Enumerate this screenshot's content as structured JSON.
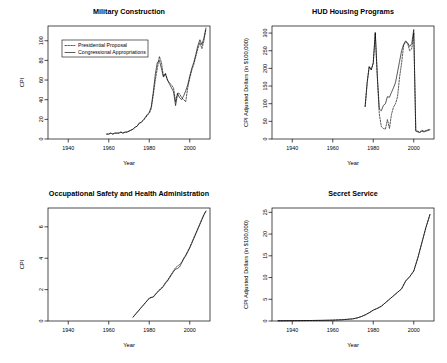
{
  "figure": {
    "layout": "2x2 panel grid of line charts",
    "background": "#ffffff",
    "line_color": "#000000"
  },
  "shared": {
    "xlabel": "Year",
    "xticks": [
      1940,
      1960,
      1980,
      2000
    ],
    "xlim": [
      1930,
      2010
    ],
    "legend": {
      "entries": [
        {
          "label": "Presidential Proposal",
          "style": "dashed"
        },
        {
          "label": "Congressional Appropriations",
          "style": "solid"
        }
      ]
    }
  },
  "chart_data": [
    {
      "type": "line",
      "panel": "top-left",
      "title": "Military Construction",
      "xlabel": "Year",
      "ylabel": "CPI",
      "xlim": [
        1930,
        2010
      ],
      "ylim": [
        0,
        115
      ],
      "xticks": [
        1940,
        1960,
        1980,
        2000
      ],
      "yticks": [
        0,
        20,
        40,
        60,
        80,
        100
      ],
      "grid": false,
      "legend_position": "top-left inside",
      "series": [
        {
          "name": "Presidential Proposal",
          "style": "dashed",
          "x": [
            1959,
            1960,
            1961,
            1962,
            1963,
            1964,
            1965,
            1966,
            1967,
            1968,
            1969,
            1970,
            1971,
            1972,
            1973,
            1974,
            1975,
            1976,
            1977,
            1978,
            1979,
            1980,
            1981,
            1982,
            1983,
            1984,
            1985,
            1986,
            1987,
            1988,
            1989,
            1990,
            1991,
            1992,
            1993,
            1994,
            1995,
            1996,
            1997,
            1998,
            1999,
            2000,
            2001,
            2002,
            2003,
            2004,
            2005,
            2006,
            2007,
            2008
          ],
          "values": [
            5,
            5,
            6,
            5,
            6,
            6,
            6,
            7,
            6,
            7,
            7,
            8,
            9,
            10,
            12,
            13,
            16,
            17,
            19,
            21,
            24,
            26,
            31,
            45,
            60,
            72,
            84,
            78,
            64,
            67,
            60,
            57,
            55,
            52,
            38,
            47,
            46,
            42,
            40,
            38,
            52,
            62,
            70,
            76,
            84,
            92,
            98,
            92,
            100,
            112
          ]
        },
        {
          "name": "Congressional Appropriations",
          "style": "solid",
          "x": [
            1959,
            1960,
            1961,
            1962,
            1963,
            1964,
            1965,
            1966,
            1967,
            1968,
            1969,
            1970,
            1971,
            1972,
            1973,
            1974,
            1975,
            1976,
            1977,
            1978,
            1979,
            1980,
            1981,
            1982,
            1983,
            1984,
            1985,
            1986,
            1987,
            1988,
            1989,
            1990,
            1991,
            1992,
            1993,
            1994,
            1995,
            1996,
            1997,
            1998,
            1999,
            2000,
            2001,
            2002,
            2003,
            2004,
            2005,
            2006,
            2007,
            2008
          ],
          "values": [
            5,
            5,
            6,
            5,
            6,
            6,
            6,
            7,
            6,
            7,
            7,
            8,
            9,
            10,
            12,
            13,
            16,
            17,
            19,
            22,
            25,
            27,
            33,
            48,
            66,
            78,
            80,
            72,
            63,
            66,
            60,
            56,
            52,
            48,
            34,
            46,
            42,
            40,
            44,
            49,
            55,
            64,
            72,
            78,
            86,
            95,
            101,
            96,
            103,
            113
          ]
        }
      ]
    },
    {
      "type": "line",
      "panel": "top-right",
      "title": "HUD Housing Programs",
      "xlabel": "Year",
      "ylabel": "CPI Adjusted Dollars (in $100,000)",
      "xlim": [
        1930,
        2010
      ],
      "ylim": [
        0,
        320
      ],
      "xticks": [
        1940,
        1960,
        1980,
        2000
      ],
      "yticks": [
        0,
        50,
        100,
        150,
        200,
        250,
        300
      ],
      "grid": false,
      "series": [
        {
          "name": "Presidential Proposal",
          "style": "dashed",
          "x": [
            1976,
            1977,
            1978,
            1979,
            1980,
            1981,
            1982,
            1983,
            1984,
            1985,
            1986,
            1987,
            1988,
            1989,
            1990,
            1991,
            1992,
            1993,
            1994,
            1995,
            1996,
            1997,
            1998,
            1999,
            2000,
            2001,
            2002,
            2003,
            2004,
            2005,
            2006,
            2007,
            2008
          ],
          "values": [
            92,
            160,
            205,
            196,
            215,
            300,
            175,
            70,
            35,
            30,
            28,
            55,
            30,
            70,
            90,
            100,
            120,
            175,
            215,
            265,
            275,
            270,
            250,
            255,
            300,
            25,
            22,
            20,
            25,
            22,
            24,
            26,
            28
          ]
        },
        {
          "name": "Congressional Appropriations",
          "style": "solid",
          "x": [
            1976,
            1977,
            1978,
            1979,
            1980,
            1981,
            1982,
            1983,
            1984,
            1985,
            1986,
            1987,
            1988,
            1989,
            1990,
            1991,
            1992,
            1993,
            1994,
            1995,
            1996,
            1997,
            1998,
            1999,
            2000,
            2001,
            2002,
            2003,
            2004,
            2005,
            2006,
            2007,
            2008
          ],
          "values": [
            92,
            160,
            205,
            196,
            215,
            302,
            180,
            85,
            80,
            95,
            100,
            120,
            118,
            132,
            145,
            160,
            190,
            220,
            250,
            268,
            278,
            272,
            262,
            270,
            310,
            22,
            20,
            18,
            22,
            20,
            22,
            24,
            26
          ]
        }
      ]
    },
    {
      "type": "line",
      "panel": "bottom-left",
      "title": "Occupational Safety and Health Administration",
      "xlabel": "Year",
      "ylabel": "CPI",
      "xlim": [
        1930,
        2010
      ],
      "ylim": [
        0,
        7.2
      ],
      "xticks": [
        1940,
        1960,
        1980,
        2000
      ],
      "yticks": [
        0,
        2,
        4,
        6
      ],
      "grid": false,
      "series": [
        {
          "name": "Presidential Proposal",
          "style": "dashed",
          "x": [
            1972,
            1973,
            1974,
            1975,
            1976,
            1977,
            1978,
            1979,
            1980,
            1981,
            1982,
            1983,
            1984,
            1985,
            1986,
            1987,
            1988,
            1989,
            1990,
            1991,
            1992,
            1993,
            1994,
            1995,
            1996,
            1997,
            1998,
            1999,
            2000,
            2001,
            2002,
            2003,
            2004,
            2005,
            2006,
            2007,
            2008
          ],
          "values": [
            0.25,
            0.4,
            0.55,
            0.7,
            0.85,
            1.0,
            1.15,
            1.3,
            1.45,
            1.5,
            1.55,
            1.7,
            1.85,
            2.0,
            2.1,
            2.25,
            2.45,
            2.6,
            2.8,
            3.0,
            3.2,
            3.4,
            3.5,
            3.6,
            3.75,
            4.0,
            4.2,
            4.45,
            4.7,
            5.0,
            5.3,
            5.6,
            5.9,
            6.2,
            6.5,
            6.8,
            7.0
          ]
        },
        {
          "name": "Congressional Appropriations",
          "style": "solid",
          "x": [
            1972,
            1973,
            1974,
            1975,
            1976,
            1977,
            1978,
            1979,
            1980,
            1981,
            1982,
            1983,
            1984,
            1985,
            1986,
            1987,
            1988,
            1989,
            1990,
            1991,
            1992,
            1993,
            1994,
            1995,
            1996,
            1997,
            1998,
            1999,
            2000,
            2001,
            2002,
            2003,
            2004,
            2005,
            2006,
            2007,
            2008
          ],
          "values": [
            0.25,
            0.4,
            0.55,
            0.7,
            0.85,
            1.0,
            1.15,
            1.3,
            1.45,
            1.5,
            1.52,
            1.68,
            1.82,
            1.95,
            2.05,
            2.2,
            2.4,
            2.55,
            2.75,
            2.95,
            3.15,
            3.3,
            3.35,
            3.45,
            3.7,
            3.95,
            4.15,
            4.4,
            4.65,
            4.95,
            5.25,
            5.55,
            5.85,
            6.15,
            6.45,
            6.75,
            7.0
          ]
        }
      ]
    },
    {
      "type": "line",
      "panel": "bottom-right",
      "title": "Secret Service",
      "xlabel": "Year",
      "ylabel": "CPI Adjusted Dollars (in $100,000)",
      "xlim": [
        1930,
        2010
      ],
      "ylim": [
        0,
        26
      ],
      "xticks": [
        1940,
        1960,
        1980,
        2000
      ],
      "yticks": [
        0,
        5,
        10,
        15,
        20,
        25
      ],
      "grid": false,
      "series": [
        {
          "name": "Presidential Proposal",
          "style": "dashed",
          "x": [
            1933,
            1940,
            1950,
            1955,
            1960,
            1965,
            1970,
            1972,
            1974,
            1976,
            1978,
            1980,
            1982,
            1984,
            1986,
            1988,
            1990,
            1992,
            1994,
            1996,
            1998,
            2000,
            2002,
            2004,
            2006,
            2008
          ],
          "values": [
            0.05,
            0.08,
            0.12,
            0.15,
            0.2,
            0.3,
            0.5,
            0.7,
            1.0,
            1.4,
            1.9,
            2.5,
            2.9,
            3.4,
            4.2,
            5.0,
            5.8,
            6.6,
            7.4,
            9.2,
            10.2,
            11.5,
            14.5,
            18.0,
            21.5,
            24.5
          ]
        },
        {
          "name": "Congressional Appropriations",
          "style": "solid",
          "x": [
            1933,
            1940,
            1950,
            1955,
            1960,
            1965,
            1970,
            1972,
            1974,
            1976,
            1978,
            1980,
            1982,
            1984,
            1986,
            1988,
            1990,
            1992,
            1994,
            1996,
            1998,
            2000,
            2002,
            2004,
            2006,
            2008
          ],
          "values": [
            0.05,
            0.08,
            0.12,
            0.15,
            0.2,
            0.3,
            0.5,
            0.7,
            1.0,
            1.4,
            1.9,
            2.5,
            2.9,
            3.4,
            4.2,
            5.0,
            5.8,
            6.6,
            7.4,
            9.2,
            10.2,
            11.5,
            14.5,
            18.0,
            21.5,
            24.5
          ]
        }
      ]
    }
  ]
}
